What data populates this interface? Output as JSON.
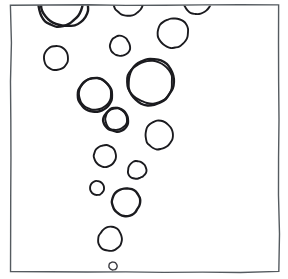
{
  "document": {
    "kind": "scanned-hand-drawing",
    "title": "Hand-drawn bubble field in rectangular frame",
    "canvas": {
      "width": 288,
      "height": 279
    },
    "background_color": "#ffffff"
  },
  "frame": {
    "label": "rectangular border",
    "x": 11,
    "y": 5,
    "width": 268,
    "height": 267,
    "stroke_color": "#555b60",
    "stroke_width": 1.4,
    "corner_jitter": 1.2
  },
  "style": {
    "ink_color": "#1b1b1f",
    "ink_color_light": "#3a3a40",
    "stroke_width_thick": 2.4,
    "stroke_width_medium": 1.9,
    "stroke_width_thin": 1.4
  },
  "chart_data": {
    "type": "scatter",
    "subtitle": "",
    "xlabel": "",
    "ylabel": "",
    "xlim": [
      11,
      279
    ],
    "ylim": [
      5,
      272
    ],
    "grid": false,
    "legend": null,
    "annotations": [],
    "point_count": 20,
    "points": [
      {
        "id": "bubble-01",
        "cx": 65,
        "cy": 4,
        "r": 23,
        "stroke": "thick",
        "clipped_by": "frame-top",
        "note": "large, top edge cut"
      },
      {
        "id": "bubble-02",
        "cx": 128,
        "cy": 1,
        "r": 15,
        "stroke": "medium",
        "clipped_by": "frame-top",
        "note": "medium, top edge cut"
      },
      {
        "id": "bubble-03",
        "cx": 197,
        "cy": 0,
        "r": 14,
        "stroke": "medium",
        "clipped_by": "frame-top",
        "note": "medium, top edge cut"
      },
      {
        "id": "bubble-04",
        "cx": 173,
        "cy": 33,
        "r": 15,
        "stroke": "medium",
        "clipped_by": null,
        "note": "upper right"
      },
      {
        "id": "bubble-05",
        "cx": 56,
        "cy": 58,
        "r": 12,
        "stroke": "medium",
        "clipped_by": null,
        "note": "left side, small tail at left"
      },
      {
        "id": "bubble-06",
        "cx": 120,
        "cy": 46,
        "r": 10,
        "stroke": "medium",
        "clipped_by": null,
        "note": "small, upper middle"
      },
      {
        "id": "bubble-07",
        "cx": 151,
        "cy": 82,
        "r": 23,
        "stroke": "thick",
        "clipped_by": null,
        "note": "largest full circle, centre right"
      },
      {
        "id": "bubble-08",
        "cx": 95,
        "cy": 95,
        "r": 17,
        "stroke": "thick",
        "clipped_by": null,
        "note": "large, centre left"
      },
      {
        "id": "bubble-09",
        "cx": 116,
        "cy": 120,
        "r": 12,
        "stroke": "thick",
        "clipped_by": null,
        "note": "medium, centre"
      },
      {
        "id": "bubble-10",
        "cx": 159,
        "cy": 135,
        "r": 14,
        "stroke": "medium",
        "clipped_by": null,
        "note": "centre right"
      },
      {
        "id": "bubble-11",
        "cx": 105,
        "cy": 156,
        "r": 11,
        "stroke": "medium",
        "clipped_by": null,
        "note": "lower centre"
      },
      {
        "id": "bubble-12",
        "cx": 137,
        "cy": 170,
        "r": 9,
        "stroke": "medium",
        "clipped_by": null,
        "note": "small, lower centre right"
      },
      {
        "id": "bubble-13",
        "cx": 97,
        "cy": 188,
        "r": 7,
        "stroke": "medium",
        "clipped_by": null,
        "note": "small, lower left of plume"
      },
      {
        "id": "bubble-14",
        "cx": 126,
        "cy": 202,
        "r": 14,
        "stroke": "thick",
        "clipped_by": null,
        "note": "medium with inward nick at left"
      },
      {
        "id": "bubble-15",
        "cx": 110,
        "cy": 239,
        "r": 12,
        "stroke": "medium",
        "clipped_by": null,
        "note": "lower, near bottom"
      },
      {
        "id": "bubble-16",
        "cx": 113,
        "cy": 266,
        "r": 4,
        "stroke": "thin",
        "clipped_by": null,
        "note": "tiny, at bottom edge"
      },
      {
        "id": "bubble-17",
        "cx": 60,
        "cy": 4,
        "r": 22,
        "stroke": "thick",
        "clipped_by": "frame-top",
        "note": "overlap stroke of bubble-01"
      },
      {
        "id": "bubble-18",
        "cx": 150,
        "cy": 82,
        "r": 22,
        "stroke": "medium",
        "clipped_by": null,
        "note": "inner wobble stroke of bubble-07"
      },
      {
        "id": "bubble-19",
        "cx": 95,
        "cy": 94,
        "r": 16,
        "stroke": "medium",
        "clipped_by": null,
        "note": "inner wobble stroke of bubble-08"
      },
      {
        "id": "bubble-20",
        "cx": 116,
        "cy": 119,
        "r": 11,
        "stroke": "medium",
        "clipped_by": null,
        "note": "inner wobble stroke of bubble-09"
      }
    ]
  }
}
